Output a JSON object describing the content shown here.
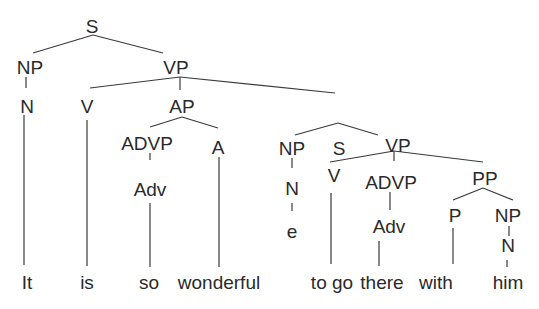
{
  "diagram": {
    "type": "syntax-tree",
    "sentence": "It is so wonderful to go there with him",
    "nodes": {
      "s_root": "S",
      "np_subj": "NP",
      "n_subj": "N",
      "vp_main": "VP",
      "v_main": "V",
      "ap": "AP",
      "advp1": "ADVP",
      "adv1": "Adv",
      "a": "A",
      "s_inner": "S",
      "np_inner": "NP",
      "n_inner": "N",
      "e": "e",
      "vp_inner": "VP",
      "v_inner": "V",
      "advp2": "ADVP",
      "adv2": "Adv",
      "pp": "PP",
      "p": "P",
      "np_obj": "NP",
      "n_obj": "N"
    },
    "words": {
      "it": "It",
      "is": "is",
      "so": "so",
      "wonderful": "wonderful",
      "to_go": "to go",
      "there": "there",
      "with": "with",
      "him": "him"
    }
  }
}
